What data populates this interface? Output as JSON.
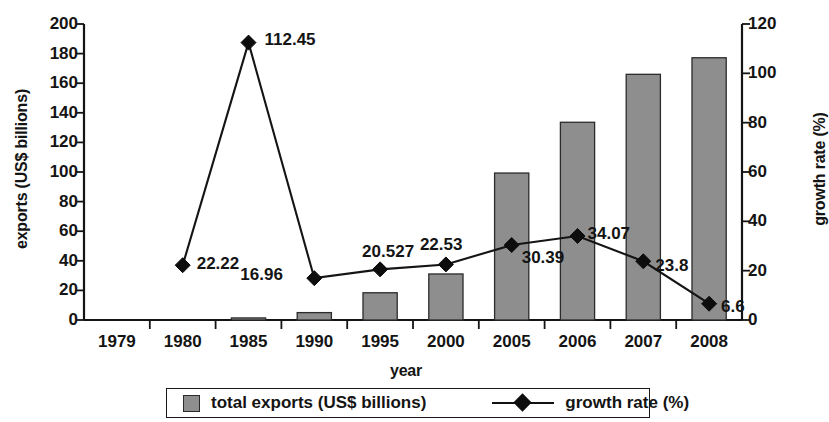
{
  "chart_data": {
    "type": "bar",
    "title": "",
    "xlabel": "year",
    "ylabel": "exports (US$ billions)",
    "y2label": "growth rate (%)",
    "categories": [
      "1979",
      "1980",
      "1985",
      "1990",
      "1995",
      "2000",
      "2005",
      "2006",
      "2007",
      "2008"
    ],
    "ylim": [
      0,
      200
    ],
    "y2lim": [
      0,
      120
    ],
    "yticks": [
      0,
      20,
      40,
      60,
      80,
      100,
      120,
      140,
      160,
      180,
      200
    ],
    "y2ticks": [
      0,
      20,
      40,
      60,
      80,
      100,
      120
    ],
    "ytick_labels": [
      "0",
      "20",
      "40",
      "60",
      "80",
      "100",
      "120",
      "140",
      "160",
      "180",
      "200"
    ],
    "y2tick_labels": [
      "0",
      "20",
      "40",
      "60",
      "80",
      "100",
      "120"
    ],
    "grid": false,
    "legend_position": "bottom",
    "series": [
      {
        "name": "total exports (US$ billions)",
        "type": "bar",
        "axis": "left",
        "color": "#8e8e8e",
        "values": [
          0,
          0,
          1.4,
          5.0,
          18.4,
          31.1,
          99.3,
          133.6,
          166.0,
          177.2
        ],
        "data_labels": [
          "",
          "",
          "",
          "",
          "",
          "",
          "",
          "",
          "",
          ""
        ]
      },
      {
        "name": "growth rate (%)",
        "type": "line",
        "axis": "right",
        "color": "#141414",
        "marker": "diamond",
        "values": [
          null,
          22.22,
          112.45,
          16.96,
          20.527,
          22.53,
          30.39,
          34.07,
          23.8,
          6.6
        ],
        "data_labels": [
          "",
          "22.22",
          "112.45",
          "16.96",
          "20.527",
          "22.53",
          "30.39",
          "34.07",
          "23.8",
          "6.6"
        ]
      }
    ],
    "annotations": [
      {
        "year": "1980",
        "text": "22.22"
      },
      {
        "year": "1985",
        "text": "112.45"
      },
      {
        "year": "1990",
        "text": "16.96"
      },
      {
        "year": "1995",
        "text": "20.527"
      },
      {
        "year": "2000",
        "text": "22.53"
      },
      {
        "year": "2005",
        "text": "30.39"
      },
      {
        "year": "2006",
        "text": "34.07"
      },
      {
        "year": "2007",
        "text": "23.8"
      },
      {
        "year": "2008",
        "text": "6.6"
      }
    ]
  },
  "legend": {
    "items": [
      {
        "label": "total exports (US$ billions)",
        "marker": "square-swatch"
      },
      {
        "label": "growth rate (%)",
        "marker": "line-diamond"
      }
    ]
  }
}
